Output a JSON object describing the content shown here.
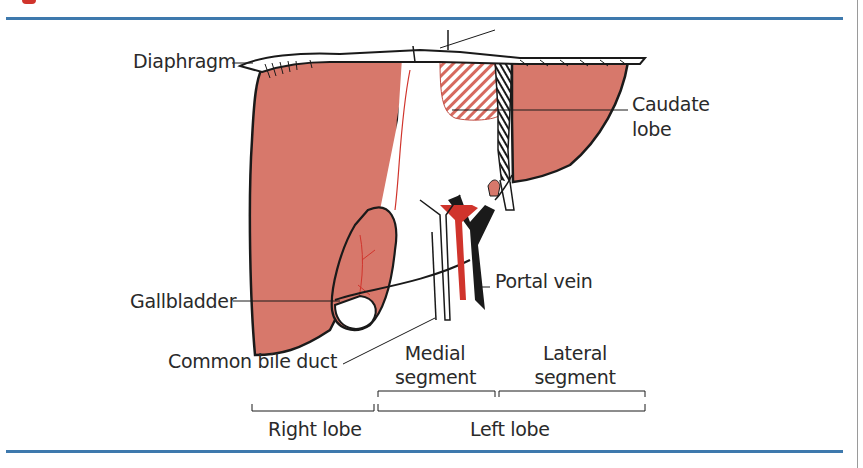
{
  "figure": {
    "colors": {
      "liver_fill": "#d7786b",
      "outline": "#1a1a1a",
      "vessel_red": "#d0342c",
      "rule_blue": "#3e79ad",
      "hatch_red": "#d66a5f"
    },
    "labels": {
      "diaphragm": "Diaphragm",
      "caudate_lobe_line1": "Caudate",
      "caudate_lobe_line2": "lobe",
      "gallbladder": "Gallbladder",
      "portal_vein": "Portal vein",
      "common_bile_duct": "Common bile duct",
      "medial_segment_line1": "Medial",
      "medial_segment_line2": "segment",
      "lateral_segment_line1": "Lateral",
      "lateral_segment_line2": "segment",
      "right_lobe": "Right lobe",
      "left_lobe": "Left lobe"
    }
  }
}
